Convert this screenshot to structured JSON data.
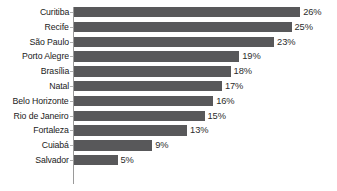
{
  "chart_data": {
    "type": "bar",
    "orientation": "horizontal",
    "title": "",
    "subtitle": "",
    "xlabel": "",
    "ylabel": "",
    "grid": false,
    "legend": false,
    "legend_position": "none",
    "xlim": [
      0,
      30
    ],
    "value_suffix": "%",
    "bar_color": "#58585a",
    "axis_color": "#9a9a9a",
    "label_color": "#1a1a1a",
    "value_label_color": "#2c2c2c",
    "background_color": "#ffffff",
    "categories": [
      "Curitiba",
      "Recife",
      "São Paulo",
      "Porto Alegre",
      "Brasília",
      "Natal",
      "Belo Horizonte",
      "Rio de Janeiro",
      "Fortaleza",
      "Cuiabá",
      "Salvador"
    ],
    "values": [
      26,
      25,
      23,
      19,
      18,
      17,
      16,
      15,
      13,
      9,
      5
    ],
    "value_labels": [
      "26%",
      "25%",
      "23%",
      "19%",
      "18%",
      "17%",
      "16%",
      "15%",
      "13%",
      "9%",
      "5%"
    ]
  }
}
